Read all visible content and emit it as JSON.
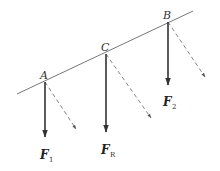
{
  "diagram": {
    "type": "force-diagram",
    "colors": {
      "line": "#777777",
      "force": "#333333",
      "dashed": "#777777",
      "text": "#333333"
    },
    "line": {
      "x1": 17,
      "y1": 94,
      "x2": 193,
      "y2": 11
    },
    "points": [
      {
        "id": "A",
        "label": "A",
        "x": 45,
        "y": 82,
        "label_x": 40,
        "label_y": 79
      },
      {
        "id": "C",
        "label": "C",
        "x": 106,
        "y": 54,
        "label_x": 101,
        "label_y": 51
      },
      {
        "id": "B",
        "label": "B",
        "x": 168,
        "y": 22,
        "label_x": 163,
        "label_y": 19
      }
    ],
    "forces": [
      {
        "id": "F1",
        "main": "F",
        "sub": "1",
        "from": "A",
        "x": 45,
        "y1": 82,
        "y2": 137,
        "label_x": 40,
        "label_y": 159
      },
      {
        "id": "FR",
        "main": "F",
        "sub": "R",
        "from": "C",
        "x": 106,
        "y1": 54,
        "y2": 132,
        "label_x": 101,
        "label_y": 154
      },
      {
        "id": "F2",
        "main": "F",
        "sub": "2",
        "from": "B",
        "x": 168,
        "y1": 22,
        "y2": 85,
        "label_x": 163,
        "label_y": 106
      }
    ],
    "dashed_forces": [
      {
        "from": "A",
        "x1": 45,
        "y1": 82,
        "x2": 76,
        "y2": 129
      },
      {
        "from": "C",
        "x1": 106,
        "y1": 54,
        "x2": 151,
        "y2": 118
      },
      {
        "from": "B",
        "x1": 168,
        "y1": 22,
        "x2": 205,
        "y2": 77
      }
    ]
  }
}
